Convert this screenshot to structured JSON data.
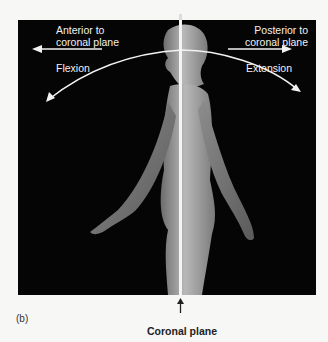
{
  "figure": {
    "panel_label": "(b)",
    "top_left_label": "Anterior to\ncoronal plane",
    "top_left_line1": "Anterior to",
    "top_left_line2": "coronal plane",
    "top_right_line1": "Posterior to",
    "top_right_line2": "coronal plane",
    "left_motion": "Flexion",
    "right_motion": "Extension",
    "bottom_caption": "Coronal plane",
    "colors": {
      "background": "#f7f7f5",
      "panel": "#050505",
      "annotation": "#f2f2f2"
    }
  }
}
